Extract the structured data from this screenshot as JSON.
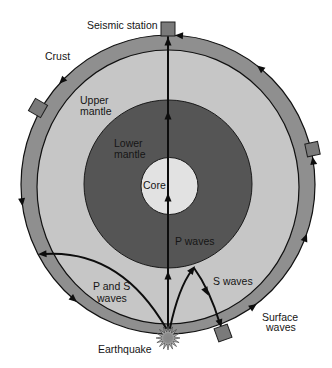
{
  "diagram": {
    "labels": {
      "seismic_station": "Seismic station",
      "crust": "Crust",
      "upper_mantle": [
        "Upper",
        "mantle"
      ],
      "lower_mantle": [
        "Lower",
        "mantle"
      ],
      "core": "Core",
      "p_waves": "P waves",
      "s_waves": "S waves",
      "p_and_s_waves": [
        "P and S",
        "waves"
      ],
      "surface_waves": [
        "Surface",
        "waves"
      ],
      "earthquake": "Earthquake"
    },
    "layers": [
      {
        "name": "Crust",
        "color": "#8f8f8f"
      },
      {
        "name": "Upper mantle",
        "color": "#c6c6c6"
      },
      {
        "name": "Lower mantle",
        "color": "#555555"
      },
      {
        "name": "Core",
        "color": "#e2e2e2"
      }
    ],
    "colors": {
      "crust": "#8f8f8f",
      "upper_mantle": "#c6c6c6",
      "lower_mantle": "#555555",
      "core": "#e2e2e2",
      "station": "#7a7a7a",
      "background": "#ffffff"
    },
    "icons": {
      "station": "station-icon",
      "earthquake": "earthquake-icon",
      "arrow": "arrowhead-icon"
    }
  }
}
